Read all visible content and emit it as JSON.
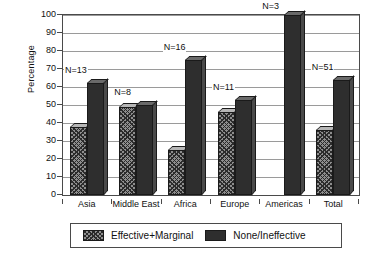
{
  "chart_data": {
    "type": "bar",
    "title": "",
    "xlabel": "",
    "ylabel": "Percentage",
    "ylim": [
      0,
      100
    ],
    "yticks": [
      0,
      10,
      20,
      30,
      40,
      50,
      60,
      70,
      80,
      90,
      100
    ],
    "grid": true,
    "legend_position": "bottom",
    "categories": [
      "Asia",
      "Middle East",
      "Africa",
      "Europe",
      "Americas",
      "Total"
    ],
    "annotations": [
      "N=13",
      "N=8",
      "N=16",
      "N=11",
      "N=3",
      "N=51"
    ],
    "series": [
      {
        "name": "Effective+Marginal",
        "color": "#8e8e8e",
        "pattern": "crosshatch",
        "values": [
          38,
          49,
          25,
          46,
          0,
          36
        ]
      },
      {
        "name": "None/Ineffective",
        "color": "#2e2e2e",
        "pattern": "solid",
        "values": [
          62,
          50,
          75,
          53,
          100,
          64
        ]
      }
    ]
  }
}
